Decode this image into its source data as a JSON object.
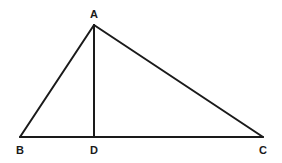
{
  "diagram": {
    "type": "geometry-triangle",
    "stroke_color": "#1a1a1a",
    "background": "#ffffff",
    "vertices": {
      "A": {
        "label": "A",
        "x": 94,
        "y": 25,
        "label_x": 94,
        "label_y": 18
      },
      "B": {
        "label": "B",
        "x": 20,
        "y": 137,
        "label_x": 20,
        "label_y": 154
      },
      "C": {
        "label": "C",
        "x": 263,
        "y": 137,
        "label_x": 263,
        "label_y": 154
      },
      "D": {
        "label": "D",
        "x": 94,
        "y": 137,
        "label_x": 94,
        "label_y": 154
      }
    },
    "segments": [
      {
        "name": "AB",
        "from": "A",
        "to": "B"
      },
      {
        "name": "AC",
        "from": "A",
        "to": "C"
      },
      {
        "name": "BC",
        "from": "B",
        "to": "C"
      },
      {
        "name": "AD",
        "from": "A",
        "to": "D"
      }
    ]
  }
}
